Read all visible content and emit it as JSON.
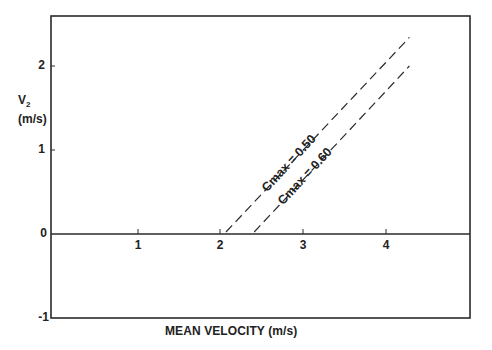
{
  "chart_data": {
    "type": "line",
    "title": "",
    "xlabel": "MEAN VELOCITY  (m/s)",
    "ylabel": "V2 (m/s)",
    "ylabel_main": "V",
    "ylabel_sub": "2",
    "ylabel_units": "(m/s)",
    "xlim": [
      0,
      5
    ],
    "ylim": [
      -1,
      2.6
    ],
    "x_ticks": [
      "1",
      "2",
      "3",
      "4"
    ],
    "y_ticks": [
      "2",
      "1",
      "0",
      "-1"
    ],
    "grid": false,
    "legend": "inline labels along lines",
    "series": [
      {
        "name": "Cmax = 0.50",
        "style": "dashed",
        "x": [
          2.06,
          4.27
        ],
        "y": [
          0.0,
          2.34
        ]
      },
      {
        "name": "Cmax = 0.60",
        "style": "dashed",
        "x": [
          2.4,
          4.27
        ],
        "y": [
          0.0,
          2.0
        ]
      }
    ]
  },
  "colors": {
    "axis": "#2a2a2a",
    "line": "#2a2a2a",
    "background": "#ffffff"
  }
}
